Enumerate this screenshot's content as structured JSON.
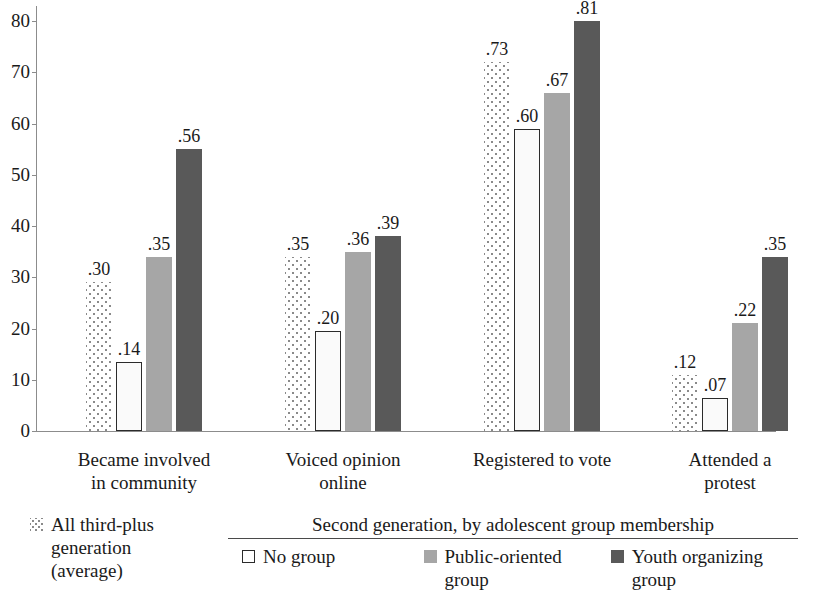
{
  "chart_data": {
    "type": "bar",
    "title": "",
    "xlabel": "",
    "ylabel": "",
    "ylim": [
      0,
      80
    ],
    "yticks": [
      0,
      10,
      20,
      30,
      40,
      50,
      60,
      70,
      80
    ],
    "ytick_labels": [
      "0",
      "10",
      "20",
      "30",
      "40",
      "50",
      "60",
      "70",
      "80"
    ],
    "grid": false,
    "legend_position": "bottom",
    "value_scale_note": "bar heights plotted as proportion x 100 on 0-80 axis",
    "categories": [
      "Became involved in community",
      "Voiced opinion online",
      "Registered to vote",
      "Attended a protest"
    ],
    "category_lines": [
      [
        "Became involved",
        "in community"
      ],
      [
        "Voiced opinion",
        "online"
      ],
      [
        "Registered to vote",
        ""
      ],
      [
        "Attended a",
        "protest"
      ]
    ],
    "series": [
      {
        "name": "All third-plus generation (average)",
        "style": "dotted",
        "values": [
          0.3,
          0.35,
          0.73,
          0.12
        ],
        "labels": [
          ".30",
          ".35",
          ".73",
          ".12"
        ],
        "plotted": [
          29,
          34,
          72,
          11
        ]
      },
      {
        "name": "No group",
        "style": "open",
        "values": [
          0.14,
          0.2,
          0.6,
          0.07
        ],
        "labels": [
          ".14",
          ".20",
          ".60",
          ".07"
        ],
        "plotted": [
          13.5,
          19.5,
          59,
          6.5
        ]
      },
      {
        "name": "Public-oriented group",
        "style": "mid-gray",
        "values": [
          0.35,
          0.36,
          0.67,
          0.22
        ],
        "labels": [
          ".35",
          ".36",
          ".67",
          ".22"
        ],
        "plotted": [
          34,
          35,
          66,
          21
        ]
      },
      {
        "name": "Youth organizing group",
        "style": "dark-gray",
        "values": [
          0.56,
          0.39,
          0.81,
          0.35
        ],
        "labels": [
          ".56",
          ".39",
          ".81",
          ".35"
        ],
        "plotted": [
          55,
          38,
          80,
          34
        ]
      }
    ]
  },
  "legend": {
    "standalone": {
      "swatch": "dotted-swatch",
      "lines": [
        "All third-plus",
        "generation",
        "(average)"
      ]
    },
    "grouped": {
      "title": "Second generation, by adolescent group membership",
      "items": [
        {
          "swatch": "open-swatch",
          "lines": [
            "No group",
            ""
          ]
        },
        {
          "swatch": "mid-gray-swatch",
          "lines": [
            "Public-oriented",
            "group"
          ]
        },
        {
          "swatch": "dark-gray-swatch",
          "lines": [
            "Youth organizing",
            "group"
          ]
        }
      ]
    }
  },
  "colors": {
    "dark_gray": "#595959",
    "mid_gray": "#a6a6a6",
    "pattern_dot": "#8a8a8a",
    "axis": "#8c8c8c",
    "text": "#1a1a1a",
    "background": "#ffffff"
  }
}
